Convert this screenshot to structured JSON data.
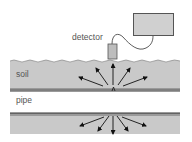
{
  "diagram": {
    "labels": {
      "detector": "detector",
      "soil": "soil",
      "pipe": "pipe"
    },
    "colors": {
      "soil_fill": "#c9c9c9",
      "pipe_wall": "#8a8a8a",
      "pipe_wall_dark": "#555555",
      "box_fill": "#d0d0d0",
      "box_stroke": "#555555",
      "arrow": "#111111",
      "text": "#555555"
    }
  }
}
